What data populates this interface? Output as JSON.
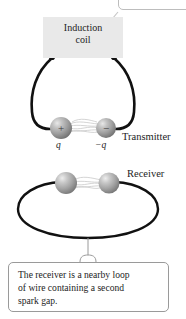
{
  "figure": {
    "background_color": "#ffffff",
    "width": 186,
    "height": 319
  },
  "induction_coil": {
    "label_line1": "Induction",
    "label_line2": "coil",
    "box_color": "#e9e9e9",
    "terminal_color": "#111111"
  },
  "transmitter": {
    "label": "Transmitter",
    "positive_sign": "+",
    "negative_sign": "−",
    "positive_charge_label": "q",
    "negative_charge_label": "−q",
    "wire_color": "#111111",
    "sphere_color": "#9b9b9b",
    "spark_color": "#c9c9c9"
  },
  "receiver": {
    "label": "Receiver",
    "loop_color": "#111111",
    "sphere_color": "#9b9b9b",
    "spark_color": "#c9c9c9"
  },
  "caption": {
    "line1": "The receiver is a nearby loop",
    "line2": "of wire containing a second",
    "line3": "spark gap.",
    "border_color": "#9a9a9a"
  },
  "top_callout": {
    "leader_color": "#bdbdbd",
    "border_color": "#bdbdbd"
  }
}
